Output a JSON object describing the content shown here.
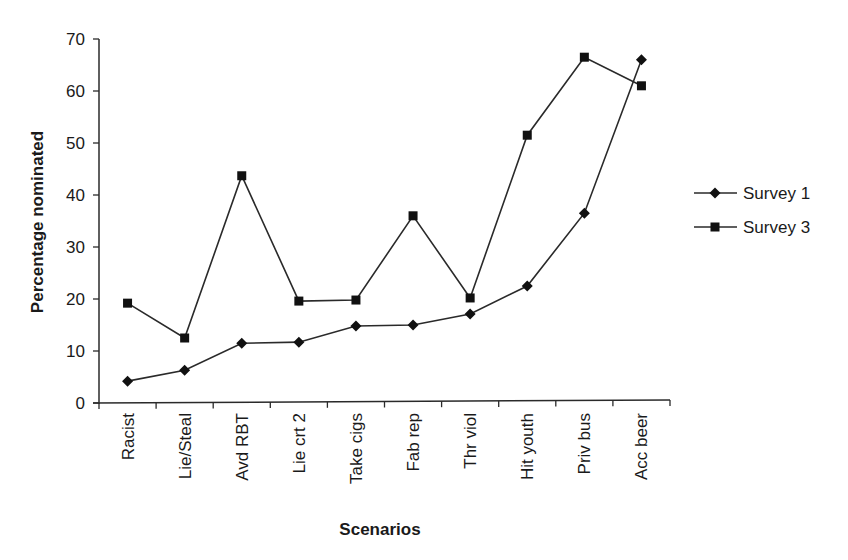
{
  "chart_data": {
    "type": "line",
    "title": "",
    "xlabel": "Scenarios",
    "ylabel": "Percentage nominated",
    "ylim": [
      0,
      70
    ],
    "yticks": [
      0,
      10,
      20,
      30,
      40,
      50,
      60,
      70
    ],
    "grid": false,
    "legend_position": "right",
    "categories": [
      "Racist",
      "Lie/Steal",
      "Avd RBT",
      "Lie crt 2",
      "Take cigs",
      "Fab rep",
      "Thr viol",
      "Hit youth",
      "Priv bus",
      "Acc beer"
    ],
    "series": [
      {
        "name": "Survey 1",
        "marker": "diamond",
        "values": [
          4.2,
          6.3,
          11.5,
          11.7,
          14.8,
          15.0,
          17.1,
          22.5,
          36.5,
          66.0
        ]
      },
      {
        "name": "Survey 3",
        "marker": "square",
        "values": [
          19.2,
          12.5,
          43.7,
          19.6,
          19.8,
          36.0,
          20.2,
          51.5,
          66.5,
          61.0
        ]
      }
    ]
  },
  "colors": {
    "line": "#2a2a2a",
    "marker": "#111111",
    "text": "#1a1a1a"
  }
}
